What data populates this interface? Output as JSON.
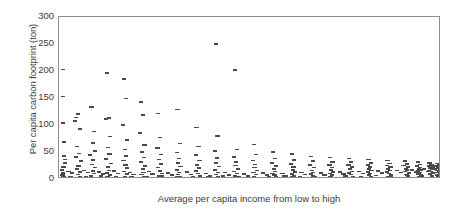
{
  "chart_data": {
    "type": "scatter",
    "title": "",
    "xlabel": "Average per capita income from low to high",
    "ylabel": "Per capita carbon footprint (ton)",
    "xlim": [
      0,
      100
    ],
    "ylim": [
      0,
      300
    ],
    "grid": false,
    "legend": null,
    "marker": "horizontal-dash",
    "marker_color": "#4a4a4a",
    "xtick_labels": [],
    "ytick_labels": [
      "0",
      "50",
      "100",
      "150",
      "200",
      "250",
      "300"
    ],
    "ytick_values": [
      0,
      50,
      100,
      150,
      200,
      250,
      300
    ],
    "points": [
      [
        1.0,
        203
      ],
      [
        1.0,
        153
      ],
      [
        1.1,
        104
      ],
      [
        1.3,
        69
      ],
      [
        1.4,
        43
      ],
      [
        1.5,
        36
      ],
      [
        1.6,
        30
      ],
      [
        1.2,
        22
      ],
      [
        0.8,
        17
      ],
      [
        1.0,
        12
      ],
      [
        1.1,
        9
      ],
      [
        0.9,
        7
      ],
      [
        1.4,
        5
      ],
      [
        1.2,
        3.5
      ],
      [
        0.7,
        2
      ],
      [
        1.3,
        1
      ],
      [
        4.5,
        114
      ],
      [
        5.0,
        120
      ],
      [
        4.2,
        107
      ],
      [
        5.5,
        93
      ],
      [
        4.8,
        60
      ],
      [
        5.2,
        47
      ],
      [
        4.4,
        41
      ],
      [
        5.8,
        33
      ],
      [
        5.1,
        24
      ],
      [
        4.7,
        18
      ],
      [
        5.4,
        13
      ],
      [
        4.9,
        8
      ],
      [
        5.6,
        5
      ],
      [
        5.0,
        2.5
      ],
      [
        4.3,
        1
      ],
      [
        8.5,
        133
      ],
      [
        9.2,
        88
      ],
      [
        8.8,
        67
      ],
      [
        9.5,
        52
      ],
      [
        8.2,
        44
      ],
      [
        9.0,
        35
      ],
      [
        8.6,
        27
      ],
      [
        9.4,
        21
      ],
      [
        8.9,
        15
      ],
      [
        9.1,
        10
      ],
      [
        8.4,
        6
      ],
      [
        9.3,
        3
      ],
      [
        8.7,
        1.5
      ],
      [
        12.5,
        196
      ],
      [
        13.0,
        113
      ],
      [
        12.2,
        111
      ],
      [
        13.4,
        79
      ],
      [
        12.8,
        58
      ],
      [
        13.2,
        46
      ],
      [
        12.4,
        37
      ],
      [
        13.6,
        29
      ],
      [
        12.9,
        22
      ],
      [
        13.1,
        16
      ],
      [
        12.6,
        11
      ],
      [
        13.3,
        7
      ],
      [
        12.7,
        4
      ],
      [
        13.0,
        1.5
      ],
      [
        17.0,
        185
      ],
      [
        17.5,
        149
      ],
      [
        16.8,
        100
      ],
      [
        17.8,
        72
      ],
      [
        17.2,
        55
      ],
      [
        17.6,
        43
      ],
      [
        16.9,
        34
      ],
      [
        17.4,
        26
      ],
      [
        17.9,
        20
      ],
      [
        17.1,
        14
      ],
      [
        17.7,
        9
      ],
      [
        17.3,
        5
      ],
      [
        17.5,
        2
      ],
      [
        21.5,
        143
      ],
      [
        22.0,
        118
      ],
      [
        21.2,
        85
      ],
      [
        22.4,
        63
      ],
      [
        21.8,
        50
      ],
      [
        22.2,
        40
      ],
      [
        21.4,
        31
      ],
      [
        22.6,
        24
      ],
      [
        21.9,
        18
      ],
      [
        22.1,
        12
      ],
      [
        21.6,
        8
      ],
      [
        22.3,
        4
      ],
      [
        21.7,
        1.5
      ],
      [
        26.0,
        121
      ],
      [
        26.5,
        77
      ],
      [
        25.8,
        57
      ],
      [
        26.8,
        45
      ],
      [
        26.2,
        36
      ],
      [
        26.6,
        28
      ],
      [
        25.9,
        21
      ],
      [
        26.4,
        15
      ],
      [
        26.9,
        10
      ],
      [
        26.1,
        6
      ],
      [
        26.7,
        3
      ],
      [
        26.3,
        1
      ],
      [
        31.0,
        129
      ],
      [
        31.6,
        66
      ],
      [
        30.8,
        49
      ],
      [
        31.4,
        38
      ],
      [
        31.2,
        30
      ],
      [
        31.8,
        23
      ],
      [
        30.9,
        17
      ],
      [
        31.5,
        12
      ],
      [
        31.1,
        8
      ],
      [
        31.7,
        4.5
      ],
      [
        31.3,
        2
      ],
      [
        36.0,
        95
      ],
      [
        36.5,
        60
      ],
      [
        35.8,
        44
      ],
      [
        36.8,
        34
      ],
      [
        36.2,
        26
      ],
      [
        36.6,
        20
      ],
      [
        35.9,
        15
      ],
      [
        36.4,
        10
      ],
      [
        36.9,
        6
      ],
      [
        36.1,
        3
      ],
      [
        36.7,
        1.2
      ],
      [
        41.0,
        250
      ],
      [
        41.5,
        80
      ],
      [
        40.8,
        52
      ],
      [
        41.4,
        39
      ],
      [
        41.2,
        30
      ],
      [
        41.8,
        23
      ],
      [
        40.9,
        17
      ],
      [
        41.6,
        12
      ],
      [
        41.1,
        8
      ],
      [
        41.7,
        4
      ],
      [
        41.3,
        1.5
      ],
      [
        46.0,
        202
      ],
      [
        46.6,
        55
      ],
      [
        45.8,
        41
      ],
      [
        46.4,
        32
      ],
      [
        46.2,
        25
      ],
      [
        46.8,
        19
      ],
      [
        45.9,
        14
      ],
      [
        46.5,
        10
      ],
      [
        46.1,
        6
      ],
      [
        46.7,
        3
      ],
      [
        46.3,
        1
      ],
      [
        51.0,
        64
      ],
      [
        51.5,
        45
      ],
      [
        50.8,
        34
      ],
      [
        51.4,
        27
      ],
      [
        51.2,
        21
      ],
      [
        51.8,
        16
      ],
      [
        50.9,
        12
      ],
      [
        51.6,
        8
      ],
      [
        51.1,
        5
      ],
      [
        51.7,
        2.5
      ],
      [
        51.3,
        1
      ],
      [
        56.0,
        50
      ],
      [
        56.5,
        38
      ],
      [
        55.8,
        30
      ],
      [
        56.8,
        24
      ],
      [
        56.2,
        19
      ],
      [
        56.6,
        14
      ],
      [
        55.9,
        10
      ],
      [
        56.4,
        7
      ],
      [
        56.9,
        4
      ],
      [
        56.1,
        2
      ],
      [
        56.7,
        1
      ],
      [
        61.0,
        46
      ],
      [
        61.6,
        35
      ],
      [
        60.8,
        28
      ],
      [
        61.4,
        22
      ],
      [
        61.2,
        17
      ],
      [
        61.8,
        13
      ],
      [
        60.9,
        9
      ],
      [
        61.5,
        6
      ],
      [
        61.1,
        3.5
      ],
      [
        61.7,
        1.8
      ],
      [
        61.3,
        0.8
      ],
      [
        66.0,
        42
      ],
      [
        66.5,
        33
      ],
      [
        65.8,
        26
      ],
      [
        66.8,
        21
      ],
      [
        66.2,
        16
      ],
      [
        66.6,
        12
      ],
      [
        65.9,
        9
      ],
      [
        66.4,
        6
      ],
      [
        66.9,
        3.5
      ],
      [
        66.1,
        2
      ],
      [
        66.7,
        1
      ],
      [
        71.0,
        40
      ],
      [
        71.6,
        32
      ],
      [
        70.8,
        26
      ],
      [
        71.4,
        21
      ],
      [
        71.2,
        17
      ],
      [
        71.8,
        13
      ],
      [
        70.9,
        10
      ],
      [
        71.5,
        7
      ],
      [
        71.1,
        4
      ],
      [
        71.7,
        2
      ],
      [
        71.3,
        1
      ],
      [
        76.0,
        38
      ],
      [
        76.5,
        31
      ],
      [
        75.8,
        26
      ],
      [
        76.8,
        22
      ],
      [
        76.2,
        18
      ],
      [
        76.6,
        14
      ],
      [
        75.9,
        11
      ],
      [
        76.4,
        8
      ],
      [
        76.9,
        5
      ],
      [
        76.1,
        3
      ],
      [
        76.7,
        1.5
      ],
      [
        81.0,
        36
      ],
      [
        81.6,
        30
      ],
      [
        80.8,
        26
      ],
      [
        81.4,
        22
      ],
      [
        81.2,
        19
      ],
      [
        81.8,
        16
      ],
      [
        80.9,
        13
      ],
      [
        81.5,
        10
      ],
      [
        81.1,
        7
      ],
      [
        81.7,
        4
      ],
      [
        81.3,
        2
      ],
      [
        86.0,
        34
      ],
      [
        86.5,
        29
      ],
      [
        85.8,
        25
      ],
      [
        86.8,
        22
      ],
      [
        86.2,
        19
      ],
      [
        86.6,
        16
      ],
      [
        85.9,
        13
      ],
      [
        86.4,
        10
      ],
      [
        86.9,
        7
      ],
      [
        86.1,
        5
      ],
      [
        86.7,
        2.5
      ],
      [
        90.5,
        33
      ],
      [
        91.0,
        28
      ],
      [
        90.2,
        25
      ],
      [
        91.4,
        22
      ],
      [
        90.8,
        19
      ],
      [
        91.2,
        17
      ],
      [
        90.6,
        14
      ],
      [
        91.6,
        11
      ],
      [
        90.9,
        8
      ],
      [
        91.3,
        6
      ],
      [
        90.4,
        3
      ],
      [
        94.0,
        31
      ],
      [
        94.6,
        27
      ],
      [
        93.8,
        24
      ],
      [
        94.4,
        21
      ],
      [
        94.2,
        19
      ],
      [
        94.8,
        17
      ],
      [
        93.9,
        15
      ],
      [
        94.5,
        12
      ],
      [
        94.1,
        9
      ],
      [
        94.7,
        7
      ],
      [
        94.3,
        4
      ],
      [
        97.0,
        30
      ],
      [
        97.5,
        26
      ],
      [
        96.8,
        24
      ],
      [
        97.8,
        22
      ],
      [
        97.2,
        20
      ],
      [
        97.6,
        18
      ],
      [
        96.9,
        16
      ],
      [
        97.4,
        14
      ],
      [
        97.9,
        11
      ],
      [
        97.1,
        9
      ],
      [
        97.7,
        6
      ],
      [
        97.3,
        3
      ],
      [
        99.0,
        29
      ],
      [
        99.4,
        26
      ],
      [
        98.8,
        24
      ],
      [
        99.6,
        22
      ],
      [
        99.2,
        20
      ],
      [
        99.8,
        18
      ],
      [
        98.9,
        16
      ],
      [
        99.5,
        14
      ],
      [
        99.1,
        12
      ],
      [
        99.7,
        9
      ],
      [
        99.3,
        6
      ],
      [
        99.9,
        3
      ],
      [
        2.5,
        14
      ],
      [
        3.5,
        11
      ],
      [
        6.5,
        16
      ],
      [
        7.5,
        12
      ],
      [
        10.5,
        13
      ],
      [
        11.5,
        9
      ],
      [
        14.5,
        15
      ],
      [
        15.5,
        10
      ],
      [
        18.5,
        12
      ],
      [
        19.5,
        8
      ],
      [
        23.5,
        14
      ],
      [
        24.5,
        9
      ],
      [
        28.5,
        11
      ],
      [
        29.5,
        7
      ],
      [
        33.5,
        13
      ],
      [
        34.5,
        8
      ],
      [
        38.5,
        10
      ],
      [
        39.5,
        6
      ],
      [
        43.5,
        12
      ],
      [
        44.5,
        7
      ],
      [
        48.5,
        9
      ],
      [
        49.5,
        6
      ],
      [
        53.5,
        11
      ],
      [
        54.5,
        7
      ],
      [
        58.5,
        10
      ],
      [
        59.5,
        6
      ],
      [
        63.5,
        12
      ],
      [
        64.5,
        8
      ],
      [
        68.5,
        11
      ],
      [
        69.5,
        7
      ],
      [
        73.5,
        13
      ],
      [
        74.5,
        9
      ],
      [
        78.5,
        14
      ],
      [
        79.5,
        10
      ],
      [
        83.5,
        15
      ],
      [
        84.5,
        11
      ],
      [
        88.5,
        16
      ],
      [
        89.5,
        12
      ],
      [
        92.5,
        17
      ],
      [
        93.5,
        13
      ],
      [
        95.5,
        18
      ],
      [
        96.5,
        14
      ],
      [
        98.5,
        19
      ],
      [
        99.5,
        15
      ],
      [
        2.0,
        0.6
      ],
      [
        4.0,
        0.8
      ],
      [
        6.0,
        0.5
      ],
      [
        8.0,
        0.9
      ],
      [
        10.0,
        0.6
      ],
      [
        12.0,
        1.1
      ],
      [
        14.0,
        0.7
      ],
      [
        16.0,
        1.0
      ],
      [
        18.0,
        0.6
      ],
      [
        20.0,
        1.2
      ],
      [
        22.0,
        0.8
      ],
      [
        24.0,
        1.0
      ],
      [
        26.0,
        0.6
      ],
      [
        28.0,
        1.3
      ],
      [
        30.0,
        0.9
      ],
      [
        32.0,
        1.1
      ],
      [
        34.0,
        0.7
      ],
      [
        36.0,
        1.4
      ],
      [
        38.0,
        1.0
      ],
      [
        40.0,
        1.2
      ],
      [
        42.0,
        0.8
      ],
      [
        44.0,
        1.5
      ],
      [
        46.0,
        1.1
      ],
      [
        48.0,
        1.3
      ],
      [
        50.0,
        0.9
      ],
      [
        52.0,
        1.6
      ],
      [
        54.0,
        1.2
      ],
      [
        56.0,
        1.4
      ],
      [
        58.0,
        1.0
      ],
      [
        60.0,
        1.7
      ],
      [
        62.0,
        1.3
      ],
      [
        64.0,
        1.5
      ],
      [
        66.0,
        1.1
      ],
      [
        68.0,
        1.8
      ],
      [
        70.0,
        1.4
      ],
      [
        72.0,
        1.6
      ],
      [
        74.0,
        1.2
      ],
      [
        76.0,
        2.0
      ],
      [
        78.0,
        1.6
      ],
      [
        80.0,
        1.8
      ],
      [
        82.0,
        1.4
      ],
      [
        84.0,
        2.2
      ],
      [
        86.0,
        1.8
      ],
      [
        88.0,
        2.0
      ],
      [
        90.0,
        1.6
      ],
      [
        92.0,
        2.4
      ],
      [
        94.0,
        2.0
      ],
      [
        96.0,
        2.2
      ],
      [
        98.0,
        1.8
      ],
      [
        100.0,
        2.5
      ],
      [
        3.0,
        5
      ],
      [
        7.0,
        4
      ],
      [
        11.0,
        5.5
      ],
      [
        15.0,
        4.5
      ],
      [
        19.0,
        5
      ],
      [
        23.0,
        4
      ],
      [
        27.0,
        5.5
      ],
      [
        31.0,
        4.5
      ],
      [
        35.0,
        5
      ],
      [
        39.0,
        4
      ],
      [
        43.0,
        5.5
      ],
      [
        47.0,
        4.5
      ],
      [
        51.0,
        5
      ],
      [
        55.0,
        4
      ],
      [
        59.0,
        5.5
      ],
      [
        63.0,
        4.5
      ],
      [
        67.0,
        5
      ],
      [
        71.0,
        4
      ],
      [
        75.0,
        6
      ],
      [
        79.0,
        5
      ],
      [
        83.0,
        6.5
      ],
      [
        87.0,
        5.5
      ],
      [
        91.0,
        7
      ],
      [
        95.0,
        6
      ],
      [
        99.0,
        7.5
      ]
    ]
  }
}
